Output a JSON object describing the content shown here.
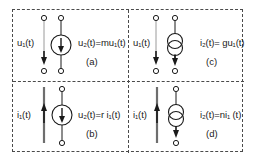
{
  "figure": {
    "border_color": "#4a4a4a",
    "ink_color": "#1a1a1a",
    "quadrants": [
      {
        "id": "a",
        "caption": "(a)",
        "input_label": "u₁(t)",
        "input_var": "u",
        "input_sub": "1",
        "output_label": "u₂(t)=mu₁(t)",
        "source_symbol": "voltage-source-arrow",
        "input_port": "open-terminals",
        "input_arrow": "down",
        "coefficient": "m",
        "type": "VCVS"
      },
      {
        "id": "b",
        "caption": "(b)",
        "input_label": "i₁(t)",
        "input_var": "i",
        "input_sub": "1",
        "output_label": "u₂(t)=r i₁(t)",
        "source_symbol": "voltage-source-arrow",
        "input_port": "short-circuit",
        "input_arrow": "up",
        "coefficient": "r",
        "type": "CCVS"
      },
      {
        "id": "c",
        "caption": "(c)",
        "input_label": "u₁(t)",
        "input_var": "u",
        "input_sub": "1",
        "output_label": "i₂(t)= gu₁(t)",
        "source_symbol": "current-source-double-circle",
        "input_port": "open-terminals",
        "input_arrow": "down",
        "coefficient": "g",
        "type": "VCCS"
      },
      {
        "id": "d",
        "caption": "(d)",
        "input_label": "i₁(t)",
        "input_var": "i",
        "input_sub": "1",
        "output_label": "i₂(t)=ni₁ (t)",
        "source_symbol": "current-source-double-circle",
        "input_port": "short-circuit",
        "input_arrow": "up",
        "coefficient": "n",
        "type": "CCCS"
      }
    ],
    "icons": {
      "terminal": "open-circle-terminal",
      "arrow_down": "arrow-down-icon",
      "arrow_up": "arrow-up-icon"
    }
  }
}
